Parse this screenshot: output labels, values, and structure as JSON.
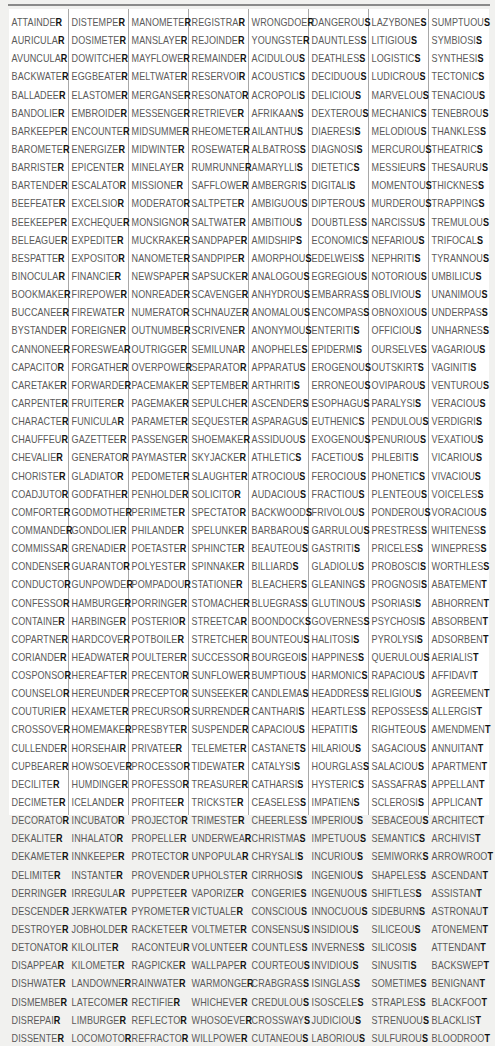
{
  "columns": [
    {
      "final_letter": "R",
      "words": [
        "ATTAINDER",
        "AURICULAR",
        "AVUNCULAR",
        "BACKWATER",
        "BALLADEER",
        "BANDOLIER",
        "BARKEEPER",
        "BAROMETER",
        "BARRISTER",
        "BARTENDER",
        "BEEFEATER",
        "BEEKEEPER",
        "BELEAGUER",
        "BESPATTER",
        "BINOCULAR",
        "BOOKMAKER",
        "BUCCANEER",
        "BYSTANDER",
        "CANNONEER",
        "CAPACITOR",
        "CARETAKER",
        "CARPENTER",
        "CHARACTER",
        "CHAUFFEUR",
        "CHEVALIER",
        "CHORISTER",
        "COADJUTOR",
        "COMFORTER",
        "COMMANDER",
        "COMMISSAR",
        "CONDENSER",
        "CONDUCTOR",
        "CONFESSOR",
        "CONTAINER",
        "COPARTNER",
        "CORIANDER",
        "COSPONSOR",
        "COUNSELOR",
        "COUTURIER",
        "CROSSOVER",
        "CULLENDER",
        "CUPBEARER",
        "DECILITER",
        "DECIMETER",
        "DECORATOR",
        "DEKALITER",
        "DEKAMETER",
        "DELIMITER",
        "DERRINGER",
        "DESCENDER",
        "DESTROYER",
        "DETONATOR",
        "DISAPPEAR",
        "DISHWATER",
        "DISMEMBER",
        "DISREPAIR",
        "DISSENTER"
      ]
    },
    {
      "final_letter": "R",
      "words": [
        "DISTEMPER",
        "DOSIMETER",
        "DOWITCHER",
        "EGGBEATER",
        "ELASTOMER",
        "EMBROIDER",
        "ENCOUNTER",
        "ENERGIZER",
        "EPICENTER",
        "ESCALATOR",
        "EXCELSIOR",
        "EXCHEQUER",
        "EXPEDITER",
        "EXPOSITOR",
        "FINANCIER",
        "FIREPOWER",
        "FIREWATER",
        "FOREIGNER",
        "FORESWEAR",
        "FORGATHER",
        "FORWARDER",
        "FRUITERER",
        "FUNICULAR",
        "GAZETTEER",
        "GENERATOR",
        "GLADIATOR",
        "GODFATHER",
        "GODMOTHER",
        "GONDOLIER",
        "GRENADIER",
        "GUARANTOR",
        "GUNPOWDER",
        "HAMBURGER",
        "HARBINGER",
        "HARDCOVER",
        "HEADWATER",
        "HEREAFTER",
        "HEREUNDER",
        "HEXAMETER",
        "HOMEMAKER",
        "HORSEHAIR",
        "HOWSOEVER",
        "HUMDINGER",
        "ICELANDER",
        "INCUBATOR",
        "INHALATOR",
        "INNKEEPER",
        "INSTANTER",
        "IRREGULAR",
        "JERKWATER",
        "JOBHOLDER",
        "KILOLITER",
        "KILOMETER",
        "LANDOWNER",
        "LATECOMER",
        "LIMBURGER",
        "LOCOMOTOR"
      ]
    },
    {
      "final_letter": "R",
      "words": [
        "MANOMETER",
        "MANSLAYER",
        "MAYFLOWER",
        "MELTWATER",
        "MERGANSER",
        "MESSENGER",
        "MIDSUMMER",
        "MIDWINTER",
        "MINELAYER",
        "MISSIONER",
        "MODERATOR",
        "MONSIGNOR",
        "MUCKRAKER",
        "NANOMETER",
        "NEWSPAPER",
        "NONREADER",
        "NUMERATOR",
        "OUTNUMBER",
        "OUTRIGGER",
        "OVERPOWER",
        "PACEMAKER",
        "PAGEMAKER",
        "PARAMETER",
        "PASSENGER",
        "PAYMASTER",
        "PEDOMETER",
        "PENHOLDER",
        "PERIMETER",
        "PHILANDER",
        "POETASTER",
        "POLYESTER",
        "POMPADOUR",
        "PORRINGER",
        "POSTERIOR",
        "POTBOILER",
        "POULTERER",
        "PRECENTOR",
        "PRECEPTOR",
        "PRECURSOR",
        "PRESBYTER",
        "PRIVATEER",
        "PROCESSOR",
        "PROFESSOR",
        "PROFITEER",
        "PROJECTOR",
        "PROPELLER",
        "PROTECTOR",
        "PROVENDER",
        "PUPPETEER",
        "PYROMETER",
        "RACKETEER",
        "RACONTEUR",
        "RAGPICKER",
        "RAINWATER",
        "RECTIFIER",
        "REFLECTOR",
        "REFRACTOR"
      ]
    },
    {
      "final_letter": "R",
      "words": [
        "REGISTRAR",
        "REJOINDER",
        "REMAINDER",
        "RESERVOIR",
        "RESONATOR",
        "RETRIEVER",
        "RHEOMETER",
        "ROSEWATER",
        "RUMRUNNER",
        "SAFFLOWER",
        "SALTPETER",
        "SALTWATER",
        "SANDPAPER",
        "SANDPIPER",
        "SAPSUCKER",
        "SCAVENGER",
        "SCHNAUZER",
        "SCRIVENER",
        "SEMILUNAR",
        "SEPARATOR",
        "SEPTEMBER",
        "SEPULCHER",
        "SEQUESTER",
        "SHOEMAKER",
        "SKYJACKER",
        "SLAUGHTER",
        "SOLICITOR",
        "SPECTATOR",
        "SPELUNKER",
        "SPHINCTER",
        "SPINNAKER",
        "STATIONER",
        "STOMACHER",
        "STREETCAR",
        "STRETCHER",
        "SUCCESSOR",
        "SUNFLOWER",
        "SUNSEEKER",
        "SURRENDER",
        "SUSPENDER",
        "TELEMETER",
        "TIDEWATER",
        "TREASURER",
        "TRICKSTER",
        "TRIMESTER",
        "UNDERWEAR",
        "UNPOPULAR",
        "UPHOLSTER",
        "VAPORIZER",
        "VICTUALER",
        "VOLTMETER",
        "VOLUNTEER",
        "WALLPAPER",
        "WARMONGER",
        "WHICHEVER",
        "WHOSOEVER",
        "WILLPOWER"
      ]
    },
    {
      "final_letter": "S",
      "words": [
        "WRONGDOER",
        "YOUNGSTER",
        "ACIDULOUS",
        "ACOUSTICS",
        "ACROPOLIS",
        "AFRIKAANS",
        "AILANTHUS",
        "ALBATROSS",
        "AMARYLLIS",
        "AMBERGRIS",
        "AMBIGUOUS",
        "AMBITIOUS",
        "AMIDSHIPS",
        "AMORPHOUS",
        "ANALOGOUS",
        "ANHYDROUS",
        "ANOMALOUS",
        "ANONYMOUS",
        "ANOPHELES",
        "APPARATUS",
        "ARTHRITIS",
        "ASCENDERS",
        "ASPARAGUS",
        "ASSIDUOUS",
        "ATHLETICS",
        "ATROCIOUS",
        "AUDACIOUS",
        "BACKWOODS",
        "BARBAROUS",
        "BEAUTEOUS",
        "BILLIARDS",
        "BLEACHERS",
        "BLUEGRASS",
        "BOONDOCKS",
        "BOUNTEOUS",
        "BOURGEOIS",
        "BUMPTIOUS",
        "CANDLEMAS",
        "CANTHARIS",
        "CAPACIOUS",
        "CASTANETS",
        "CATALYSIS",
        "CATHARSIS",
        "CEASELESS",
        "CHEERLESS",
        "CHRISTMAS",
        "CHRYSALIS",
        "CIRRHOSIS",
        "CONGERIES",
        "CONSCIOUS",
        "CONSENSUS",
        "COUNTLESS",
        "COURTEOUS",
        "CRABGRASS",
        "CREDULOUS",
        "CROSSWAYS",
        "CUTANEOUS"
      ]
    },
    {
      "final_letter": "S",
      "words": [
        "DANGEROUS",
        "DAUNTLESS",
        "DEATHLESS",
        "DECIDUOUS",
        "DELICIOUS",
        "DEXTEROUS",
        "DIAERESIS",
        "DIAGNOSIS",
        "DIETETICS",
        "DIGITALIS",
        "DIPTEROUS",
        "DOUBTLESS",
        "ECONOMICS",
        "EDELWEISS",
        "EGREGIOUS",
        "EMBARRASS",
        "ENCOMPASS",
        "ENTERITIS",
        "EPIDERMIS",
        "EROGENOUS",
        "ERRONEOUS",
        "ESOPHAGUS",
        "EUTHENICS",
        "EXOGENOUS",
        "FACETIOUS",
        "FEROCIOUS",
        "FRACTIOUS",
        "FRIVOLOUS",
        "GARRULOUS",
        "GASTRITIS",
        "GLADIOLUS",
        "GLEANINGS",
        "GLUTINOUS",
        "GOVERNESS",
        "HALITOSIS",
        "HAPPINESS",
        "HARMONICS",
        "HEADDRESS",
        "HEARTLESS",
        "HEPATITIS",
        "HILARIOUS",
        "HOURGLASS",
        "HYSTERICS",
        "IMPATIENS",
        "IMPERIOUS",
        "IMPETUOUS",
        "INCURIOUS",
        "INGENIOUS",
        "INGENUOUS",
        "INNOCUOUS",
        "INSIDIOUS",
        "INVERNESS",
        "INVIDIOUS",
        "ISINGLASS",
        "ISOSCELES",
        "JUDICIOUS",
        "LABORIOUS"
      ]
    },
    {
      "final_letter": "S",
      "words": [
        "LAZYBONES",
        "LITIGIOUS",
        "LOGISTICS",
        "LUDICROUS",
        "MARVELOUS",
        "MECHANICS",
        "MELODIOUS",
        "MERCUROUS",
        "MESSIEURS",
        "MOMENTOUS",
        "MURDEROUS",
        "NARCISSUS",
        "NEFARIOUS",
        "NEPHRITIS",
        "NOTORIOUS",
        "OBLIVIOUS",
        "OBNOXIOUS",
        "OFFICIOUS",
        "OURSELVES",
        "OUTSKIRTS",
        "OVIPAROUS",
        "PARALYSIS",
        "PENDULOUS",
        "PENURIOUS",
        "PHLEBITIS",
        "PHONETICS",
        "PLENTEOUS",
        "PONDEROUS",
        "PRESTRESS",
        "PRICELESS",
        "PROBOSCIS",
        "PROGNOSIS",
        "PSORIASIS",
        "PSYCHOSIS",
        "PYROLYSIS",
        "QUERULOUS",
        "RAPACIOUS",
        "RELIGIOUS",
        "REPOSSESS",
        "RIGHTEOUS",
        "SAGACIOUS",
        "SALACIOUS",
        "SASSAFRAS",
        "SCLEROSIS",
        "SEBACEOUS",
        "SEMANTICS",
        "SEMIWORKS",
        "SHAPELESS",
        "SHIFTLESS",
        "SIDEBURNS",
        "SILICEOUS",
        "SILICOSIS",
        "SINUSITIS",
        "SOMETIMES",
        "STRAPLESS",
        "STRENUOUS",
        "SULFUROUS"
      ]
    },
    {
      "final_letter": "S/T",
      "words": [
        "SUMPTUOUS",
        "SYMBIOSIS",
        "SYNTHESIS",
        "TECTONICS",
        "TENACIOUS",
        "TENEBROUS",
        "THANKLESS",
        "THEATRICS",
        "THESAURUS",
        "THICKNESS",
        "TRAPPINGS",
        "TREMULOUS",
        "TRIFOCALS",
        "TYRANNOUS",
        "UMBILICUS",
        "UNANIMOUS",
        "UNDERPASS",
        "UNHARNESS",
        "VAGARIOUS",
        "VAGINITIS",
        "VENTUROUS",
        "VERACIOUS",
        "VERDIGRIS",
        "VEXATIOUS",
        "VICARIOUS",
        "VIVACIOUS",
        "VOICELESS",
        "VORACIOUS",
        "WHITENESS",
        "WINEPRESS",
        "WORTHLESS",
        "ABATEMENT",
        "ABHORRENT",
        "ABSORBENT",
        "ADSORBENT",
        "AERIALIST",
        "AFFIDAVIT",
        "AGREEMENT",
        "ALLERGIST",
        "AMENDMENT",
        "ANNUITANT",
        "APARTMENT",
        "APPELLANT",
        "APPLICANT",
        "ARCHITECT",
        "ARCHIVIST",
        "ARROWROOT",
        "ASCENDANT",
        "ASSISTANT",
        "ASTRONAUT",
        "ATONEMENT",
        "ATTENDANT",
        "BACKSWEPT",
        "BENIGNANT",
        "BLACKFOOT",
        "BLACKLIST",
        "BLOODROOT"
      ]
    }
  ]
}
